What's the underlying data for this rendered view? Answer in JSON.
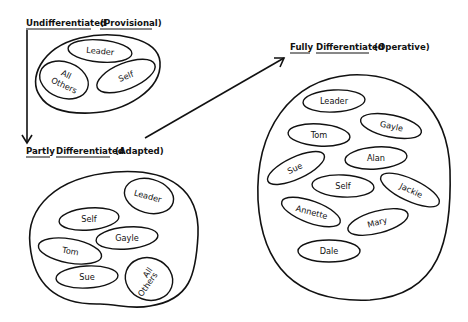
{
  "stages": [
    {
      "id": "undifferentiated",
      "title_word1": "Undifferentiated",
      "title_word2": "",
      "qualifier": "(Provisional)",
      "members": [
        "Leader",
        "All",
        "Others",
        "Self"
      ]
    },
    {
      "id": "partly",
      "title_word1": "Partly",
      "title_word2": "Differentiated",
      "qualifier": "(Adapted)",
      "members": [
        "Leader",
        "Self",
        "Gayle",
        "Tom",
        "Sue",
        "All",
        "Others"
      ]
    },
    {
      "id": "fully",
      "title_word1": "Fully",
      "title_word2": "Differentiated",
      "qualifier": "(Operative)",
      "members": [
        "Leader",
        "Gayle",
        "Tom",
        "Alan",
        "Sue",
        "Self",
        "Jackie",
        "Annette",
        "Mary",
        "Dale"
      ]
    }
  ],
  "arrows": [
    {
      "from": "undifferentiated",
      "to": "partly",
      "direction": "down"
    },
    {
      "from": "partly",
      "to": "fully",
      "direction": "up-right"
    }
  ],
  "colors": {
    "ink": "#111111",
    "background": "#ffffff"
  }
}
